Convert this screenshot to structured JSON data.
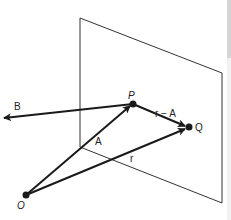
{
  "diagram": {
    "type": "vector-geometry",
    "labels": {
      "origin": "O",
      "point_p": "P",
      "point_q": "Q",
      "vector_a": "A",
      "vector_b": "B",
      "vector_r": "r",
      "vector_r_minus_a": "r − A"
    },
    "colors": {
      "line": "#1a1a1a",
      "plane": "#333333",
      "background": "#ffffff"
    }
  }
}
